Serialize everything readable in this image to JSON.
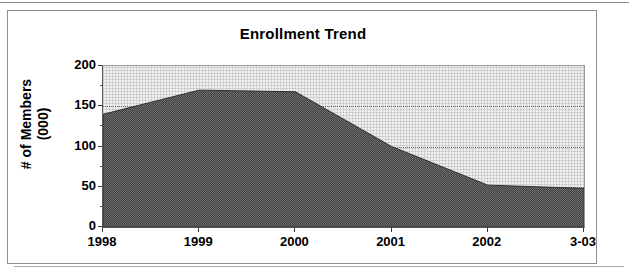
{
  "chart_data": {
    "type": "area",
    "title": "Enrollment Trend",
    "xlabel": "",
    "ylabel": "# of Members (000)",
    "ylabel_lines": [
      "# of Members",
      "(000)"
    ],
    "categories": [
      "1998",
      "1999",
      "2000",
      "2001",
      "2002",
      "3-03"
    ],
    "values": [
      140,
      170,
      168,
      100,
      52,
      48
    ],
    "series": [
      {
        "name": "Enrollment",
        "values": [
          140,
          170,
          168,
          100,
          52,
          48
        ]
      }
    ],
    "ylim": [
      0,
      200
    ],
    "ytick_values": [
      0,
      50,
      100,
      150,
      200
    ],
    "ytick_labels": [
      "0",
      "50",
      "100",
      "150",
      "200"
    ],
    "y_minor_interval": 25,
    "grid": true,
    "grid_axis": "y",
    "legend": false,
    "legend_position": "none",
    "colors": {
      "series_fill": "#787878",
      "plot_background": "#f0f0f0",
      "axis": "#555555",
      "gridline": "#6d6d6d",
      "text": "#000000",
      "frame_border": "#909090"
    }
  },
  "frame": {
    "scan_rule_top": "",
    "scan_rule_bottom": ""
  }
}
